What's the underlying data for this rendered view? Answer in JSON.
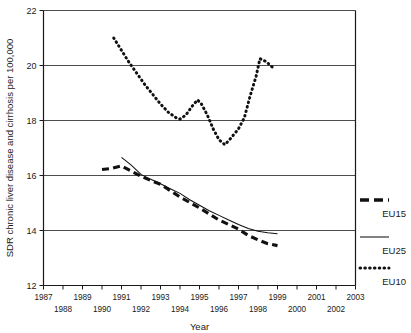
{
  "chart_data": {
    "type": "line",
    "title": "",
    "xlabel": "Year",
    "ylabel": "SDR chronic liver disease and cirrhosis per 100,000",
    "xlim": [
      1987,
      2003
    ],
    "ylim": [
      12,
      22
    ],
    "grid": true,
    "legend_position": "right",
    "y_ticks": [
      "12",
      "14",
      "16",
      "18",
      "20",
      "22"
    ],
    "y_tick_values": [
      12,
      14,
      16,
      18,
      20,
      22
    ],
    "x_ticks_top": [
      "1987",
      "1989",
      "1991",
      "1993",
      "1995",
      "1997",
      "1999",
      "2001",
      "2003"
    ],
    "x_tick_values_top": [
      1987,
      1989,
      1991,
      1993,
      1995,
      1997,
      1999,
      2001,
      2003
    ],
    "x_ticks_bottom": [
      "1988",
      "1990",
      "1992",
      "1994",
      "1996",
      "1998",
      "2000",
      "2002"
    ],
    "x_tick_values_bottom": [
      1988,
      1990,
      1992,
      1994,
      1996,
      1998,
      2000,
      2002
    ],
    "series": [
      {
        "name": "EU15",
        "style": "thick-dashed",
        "x": [
          1990.0,
          1990.5,
          1991.0,
          1991.5,
          1992.0,
          1992.5,
          1993.0,
          1993.5,
          1994.0,
          1994.5,
          1995.0,
          1995.5,
          1996.0,
          1996.5,
          1997.0,
          1997.5,
          1998.0,
          1998.5,
          1999.0
        ],
        "values": [
          16.22,
          16.26,
          16.35,
          16.16,
          15.97,
          15.82,
          15.68,
          15.45,
          15.22,
          15.02,
          14.82,
          14.6,
          14.38,
          14.22,
          14.05,
          13.82,
          13.66,
          13.52,
          13.45
        ]
      },
      {
        "name": "EU25",
        "style": "thin-solid",
        "x": [
          1991.0,
          1991.5,
          1992.0,
          1992.5,
          1993.0,
          1993.5,
          1994.0,
          1994.5,
          1995.0,
          1995.5,
          1996.0,
          1996.5,
          1997.0,
          1997.5,
          1998.0,
          1998.5,
          1999.0
        ],
        "values": [
          16.66,
          16.38,
          16.04,
          15.86,
          15.7,
          15.52,
          15.35,
          15.12,
          14.92,
          14.72,
          14.55,
          14.38,
          14.22,
          14.07,
          13.97,
          13.92,
          13.88
        ]
      },
      {
        "name": "EU10",
        "style": "dotted",
        "x": [
          1990.6,
          1991.0,
          1991.4,
          1991.8,
          1992.2,
          1992.6,
          1993.0,
          1993.4,
          1993.8,
          1994.0,
          1994.3,
          1994.6,
          1994.9,
          1995.1,
          1995.4,
          1995.7,
          1996.0,
          1996.3,
          1996.6,
          1997.0,
          1997.3,
          1997.6,
          1997.9,
          1998.1,
          1998.4,
          1998.8
        ],
        "values": [
          21.0,
          20.55,
          20.1,
          19.7,
          19.3,
          18.95,
          18.6,
          18.3,
          18.1,
          18.05,
          18.2,
          18.5,
          18.75,
          18.6,
          18.2,
          17.7,
          17.3,
          17.12,
          17.35,
          17.7,
          18.1,
          18.9,
          19.6,
          20.25,
          20.15,
          19.9
        ]
      }
    ]
  },
  "legend": {
    "items": [
      {
        "label": "EU15",
        "style": "thick-dashed"
      },
      {
        "label": "EU25",
        "style": "thin-solid"
      },
      {
        "label": "EU10",
        "style": "dotted"
      }
    ]
  }
}
